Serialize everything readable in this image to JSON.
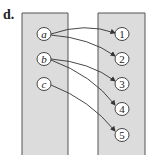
{
  "label": "d.",
  "domain_set": {
    "elements": [
      "a",
      "b",
      "c"
    ]
  },
  "codomain_set": {
    "elements": [
      "1",
      "2",
      "3",
      "4",
      "5"
    ]
  },
  "mappings": [
    {
      "from": "a",
      "to": "1"
    },
    {
      "from": "a",
      "to": "2"
    },
    {
      "from": "b",
      "to": "3"
    },
    {
      "from": "b",
      "to": "4"
    },
    {
      "from": "c",
      "to": "5"
    }
  ],
  "colors": {
    "box_fill": "#dcdcdc",
    "box_stroke": "#555555",
    "node_fill": "#ffffff",
    "arrow": "#333333"
  }
}
